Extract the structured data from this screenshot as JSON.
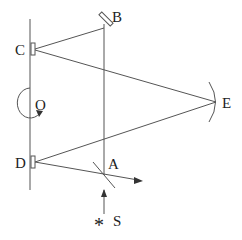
{
  "diagram": {
    "type": "optical-setup",
    "labels": {
      "A": "A",
      "B": "B",
      "C": "C",
      "D": "D",
      "E": "E",
      "O": "O",
      "S": "S"
    },
    "source_symbol": "*",
    "components": [
      {
        "id": "A",
        "kind": "beam-splitter"
      },
      {
        "id": "B",
        "kind": "plane-mirror"
      },
      {
        "id": "C",
        "kind": "mirror-on-rotating-axis"
      },
      {
        "id": "D",
        "kind": "mirror-on-rotating-axis"
      },
      {
        "id": "E",
        "kind": "concave-mirror"
      },
      {
        "id": "O",
        "kind": "rotation-direction"
      },
      {
        "id": "S",
        "kind": "light-source"
      }
    ],
    "colors": {
      "line": "#555555",
      "text": "#222222",
      "background": "#ffffff"
    }
  }
}
